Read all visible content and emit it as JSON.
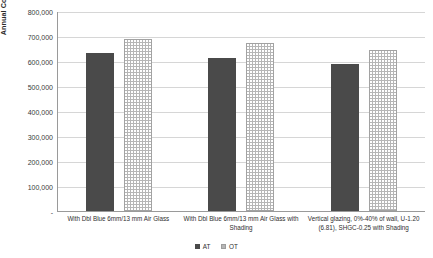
{
  "chart_data": {
    "type": "bar",
    "title": "",
    "xlabel": "",
    "ylabel": "Annual Cooling Consumption (kWh)",
    "ylim": [
      0,
      800000
    ],
    "ytick_step": 100000,
    "grid": true,
    "legend_position": "bottom",
    "categories": [
      "With Dbl Blue 6mm/13 mm Air Glass",
      "With Dbl Blue 6mm/13 mm Air Glass with Shading",
      "Vertical glazing, 0%-40% of wall, U-1.20 (6.81), SHGC-0.25 with Shading"
    ],
    "ytick_labels": [
      "800,000",
      "700,000",
      "600,000",
      "500,000",
      "400,000",
      "300,000",
      "200,000",
      "100,000",
      "-"
    ],
    "ytick_values": [
      800000,
      700000,
      600000,
      500000,
      400000,
      300000,
      200000,
      100000,
      0
    ],
    "series": [
      {
        "name": "AT",
        "color": "#4a4a4a",
        "fill": "solid",
        "values": [
          632000,
          612000,
          588000
        ]
      },
      {
        "name": "OT",
        "color": "#b6b6b6",
        "fill": "dotted-pattern",
        "values": [
          690000,
          672000,
          645000
        ]
      }
    ]
  }
}
